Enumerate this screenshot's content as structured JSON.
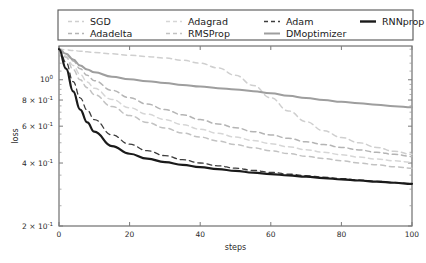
{
  "chart_data": {
    "type": "line",
    "title": "",
    "xlabel": "steps",
    "ylabel": "loss",
    "xlim": [
      0,
      100
    ],
    "ylim": [
      0.2,
      1.45
    ],
    "yscale": "log",
    "grid": false,
    "legend_position": "above-plot",
    "xticks": [
      0,
      20,
      40,
      60,
      80,
      100
    ],
    "xticklabels": [
      "0",
      "20",
      "40",
      "60",
      "80",
      "100"
    ],
    "yticks": [
      1.0,
      0.8,
      0.6,
      0.4,
      0.2
    ],
    "yticklabels": [
      "10^0",
      "8 x 10^-1",
      "6 x 10^-1",
      "4 x 10^-1",
      "2 x 10^-1"
    ],
    "x": [
      0,
      2,
      4,
      6,
      8,
      10,
      15,
      20,
      25,
      30,
      35,
      40,
      45,
      50,
      55,
      60,
      65,
      70,
      75,
      80,
      85,
      90,
      95,
      100
    ],
    "series": [
      {
        "name": "SGD",
        "color": "#cfcfcf",
        "dash": "5,4",
        "width": 1.5,
        "values": [
          1.4,
          1.39,
          1.38,
          1.37,
          1.36,
          1.35,
          1.33,
          1.31,
          1.29,
          1.27,
          1.24,
          1.2,
          1.14,
          1.05,
          0.94,
          0.82,
          0.71,
          0.63,
          0.57,
          0.53,
          0.5,
          0.475,
          0.455,
          0.44
        ]
      },
      {
        "name": "Adadelta",
        "color": "#b4b4b4",
        "dash": "5,4",
        "width": 1.5,
        "values": [
          1.4,
          1.33,
          1.23,
          1.13,
          1.05,
          0.99,
          0.89,
          0.82,
          0.765,
          0.72,
          0.68,
          0.645,
          0.615,
          0.59,
          0.565,
          0.545,
          0.525,
          0.505,
          0.49,
          0.475,
          0.462,
          0.45,
          0.44,
          0.43
        ]
      },
      {
        "name": "Adagrad",
        "color": "#d6d6d6",
        "dash": "5,4",
        "width": 1.5,
        "values": [
          1.4,
          1.3,
          1.17,
          1.06,
          0.975,
          0.91,
          0.805,
          0.735,
          0.685,
          0.645,
          0.61,
          0.58,
          0.555,
          0.532,
          0.512,
          0.495,
          0.478,
          0.463,
          0.45,
          0.438,
          0.427,
          0.418,
          0.41,
          0.403
        ]
      },
      {
        "name": "RMSProp",
        "color": "#c2c2c2",
        "dash": "5,4",
        "width": 1.5,
        "values": [
          1.4,
          1.28,
          1.12,
          1.0,
          0.915,
          0.85,
          0.745,
          0.675,
          0.625,
          0.588,
          0.557,
          0.532,
          0.51,
          0.49,
          0.473,
          0.458,
          0.444,
          0.431,
          0.42,
          0.41,
          0.4,
          0.392,
          0.384,
          0.378
        ]
      },
      {
        "name": "Adam",
        "color": "#3d3d3d",
        "dash": "5,4",
        "width": 1.3,
        "values": [
          1.4,
          1.21,
          0.98,
          0.82,
          0.715,
          0.645,
          0.545,
          0.492,
          0.458,
          0.434,
          0.415,
          0.4,
          0.388,
          0.378,
          0.369,
          0.361,
          0.354,
          0.348,
          0.342,
          0.337,
          0.332,
          0.327,
          0.323,
          0.319
        ]
      },
      {
        "name": "DMoptimizer",
        "color": "#9e9e9e",
        "dash": "none",
        "width": 2.0,
        "values": [
          1.4,
          1.33,
          1.25,
          1.17,
          1.12,
          1.085,
          1.035,
          1.005,
          0.985,
          0.965,
          0.945,
          0.928,
          0.912,
          0.898,
          0.882,
          0.862,
          0.838,
          0.818,
          0.8,
          0.785,
          0.772,
          0.76,
          0.748,
          0.738
        ]
      },
      {
        "name": "RNNprop",
        "color": "#1a1a1a",
        "dash": "none",
        "width": 2.2,
        "values": [
          1.4,
          1.13,
          0.88,
          0.72,
          0.625,
          0.565,
          0.482,
          0.443,
          0.42,
          0.404,
          0.392,
          0.382,
          0.374,
          0.367,
          0.36,
          0.354,
          0.349,
          0.344,
          0.339,
          0.334,
          0.33,
          0.326,
          0.322,
          0.318
        ]
      }
    ],
    "legend_entries": [
      {
        "label": "SGD",
        "color": "#cfcfcf",
        "dash": "4,3",
        "width": 1.6
      },
      {
        "label": "Adagrad",
        "color": "#d6d6d6",
        "dash": "4,3",
        "width": 1.6
      },
      {
        "label": "Adam",
        "color": "#3d3d3d",
        "dash": "4,3",
        "width": 1.6
      },
      {
        "label": "RNNprop",
        "color": "#1a1a1a",
        "dash": "none",
        "width": 2.4
      },
      {
        "label": "Adadelta",
        "color": "#b4b4b4",
        "dash": "4,3",
        "width": 1.6
      },
      {
        "label": "RMSProp",
        "color": "#c2c2c2",
        "dash": "4,3",
        "width": 1.6
      },
      {
        "label": "DMoptimizer",
        "color": "#9e9e9e",
        "dash": "none",
        "width": 2.0
      }
    ]
  }
}
